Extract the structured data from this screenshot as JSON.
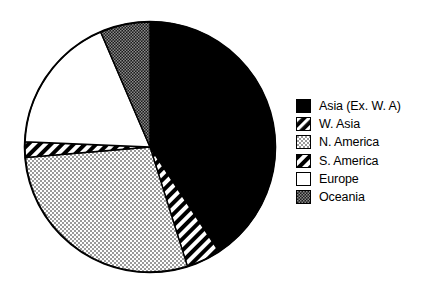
{
  "chart_data": {
    "type": "pie",
    "title": "",
    "xlabel": "",
    "ylabel": "",
    "legend_position": "right",
    "grid": false,
    "start_angle_deg": 0,
    "direction": "clockwise",
    "categories": [
      "Asia (Ex. W. A)",
      "W. Asia",
      "N. America",
      "S. America",
      "Europe",
      "Oceania"
    ],
    "values": [
      40.7,
      2.0,
      28.5,
      4.4,
      17.9,
      6.5
    ],
    "slices": [
      {
        "label": "Asia (Ex. W. A)",
        "value": 40.7,
        "start_deg": 0.0,
        "end_deg": 146.6,
        "fill": "solid-black",
        "color": "#000000"
      },
      {
        "label": "S. America",
        "value": 4.4,
        "start_deg": 146.6,
        "end_deg": 162.6,
        "fill": "diagonal-stripes-black-on-white",
        "color": "#ffffff"
      },
      {
        "label": "N. America",
        "value": 28.5,
        "start_deg": 162.6,
        "end_deg": 265.2,
        "fill": "light-gray-stipple",
        "color": "#bdbdbd"
      },
      {
        "label": "W. Asia",
        "value": 2.0,
        "start_deg": 265.2,
        "end_deg": 272.4,
        "fill": "diagonal-stripes-black-on-white",
        "color": "#ffffff"
      },
      {
        "label": "Europe",
        "value": 17.9,
        "start_deg": 272.4,
        "end_deg": 336.8,
        "fill": "solid-white",
        "color": "#ffffff"
      },
      {
        "label": "Oceania",
        "value": 6.5,
        "start_deg": 336.8,
        "end_deg": 360.0,
        "fill": "dark-gray-checker",
        "color": "#4d4d4d"
      }
    ]
  },
  "legend": {
    "items": [
      {
        "label": "Asia (Ex. W. A)",
        "swatch": "solid-black"
      },
      {
        "label": "W. Asia",
        "swatch": "diagonal-stripes-white-on-black"
      },
      {
        "label": "N. America",
        "swatch": "light-gray-stipple"
      },
      {
        "label": "S. America",
        "swatch": "diagonal-stripes-black-on-white"
      },
      {
        "label": "Europe",
        "swatch": "solid-white"
      },
      {
        "label": "Oceania",
        "swatch": "dark-gray-checker"
      }
    ]
  }
}
